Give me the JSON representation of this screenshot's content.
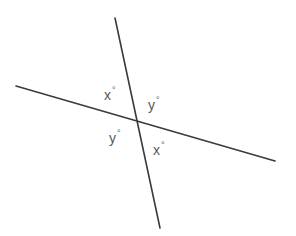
{
  "diagram": {
    "type": "intersecting-lines",
    "lines": [
      {
        "id": "line-a",
        "x1": 115,
        "y1": 18,
        "x2": 160,
        "y2": 228
      },
      {
        "id": "line-b",
        "x1": 16,
        "y1": 86,
        "x2": 275,
        "y2": 161
      }
    ],
    "intersection": {
      "x": 137,
      "y": 122
    },
    "labels": [
      {
        "position": "top-left",
        "variable": "x",
        "unit": "°",
        "x": 104,
        "y": 87
      },
      {
        "position": "top-right",
        "variable": "y",
        "unit": "°",
        "x": 148,
        "y": 97
      },
      {
        "position": "bottom-left",
        "variable": "y",
        "unit": "°",
        "x": 109,
        "y": 130
      },
      {
        "position": "bottom-right",
        "variable": "x",
        "unit": "°",
        "x": 153,
        "y": 142
      }
    ],
    "colors": {
      "line": "#3a3a3a",
      "label": "#5a5a5a",
      "background": "#ffffff"
    }
  }
}
